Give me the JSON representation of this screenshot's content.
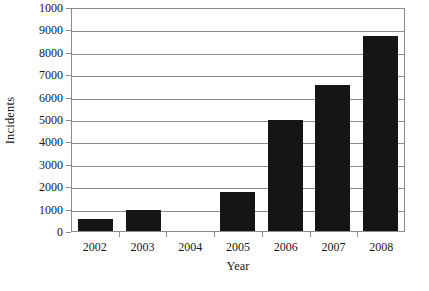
{
  "chart_data": {
    "type": "bar",
    "title": "",
    "subtitle": "",
    "xlabel": "Year",
    "ylabel": "Incidents",
    "categories": [
      "2002",
      "2003",
      "2004",
      "2005",
      "2006",
      "2007",
      "2008"
    ],
    "values": [
      550,
      950,
      0,
      1750,
      4950,
      6500,
      8700
    ],
    "series": [
      {
        "name": "Incidents",
        "values": [
          550,
          950,
          0,
          1750,
          4950,
          6500,
          8700
        ]
      }
    ],
    "ylim": [
      0,
      10000
    ],
    "xlim": [
      0,
      7
    ],
    "ytick_values": [
      0,
      1000,
      2000,
      3000,
      4000,
      5000,
      6000,
      7000,
      8000,
      9000,
      10000
    ],
    "ytick_labels": [
      "0",
      "1000",
      "2000",
      "3000",
      "4000",
      "5000",
      "6000",
      "7000",
      "8000",
      "9000",
      "1000"
    ],
    "grid": true,
    "grid_axis": "y",
    "legend": false,
    "legend_position": "none",
    "bar_color": "#151515",
    "axis_color": "#8c8c8c",
    "background_color": "#ffffff",
    "annotations": []
  }
}
